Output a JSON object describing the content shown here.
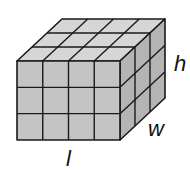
{
  "diagram": {
    "type": "rectangular-prism-unit-cubes",
    "dimensions": {
      "length_cubes": 4,
      "width_cubes": 3,
      "height_cubes": 3
    },
    "labels": {
      "length": "l",
      "width": "w",
      "height": "h"
    },
    "colors": {
      "front": "#c4c4c4",
      "top": "#d6d6d6",
      "side": "#b4b4b4",
      "edge": "#1a1a1a"
    }
  }
}
